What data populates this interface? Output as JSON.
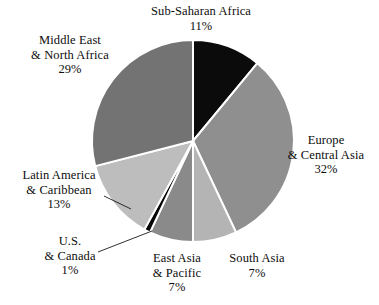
{
  "chart_data": {
    "type": "pie",
    "title": "",
    "subtitle": "",
    "xlabel": "",
    "ylabel": "",
    "legend_position": "none",
    "grid": false,
    "units": "percent",
    "start_angle_deg": 0,
    "direction": "clockwise",
    "categories": [
      "Sub-Saharan Africa",
      "Europe & Central Asia",
      "South Asia",
      "East Asia & Pacific",
      "U.S. & Canada",
      "Latin America & Caribbean",
      "Middle East & North Africa"
    ],
    "values": [
      11,
      32,
      7,
      7,
      1,
      13,
      29
    ],
    "slices": [
      {
        "name": "Sub-Saharan Africa",
        "label_lines": [
          "Sub-Saharan Africa"
        ],
        "value": 11,
        "percent_text": "11%",
        "color": "#0b0b0b",
        "start_deg": 0,
        "end_deg": 39.6,
        "leader_line": false
      },
      {
        "name": "Europe & Central Asia",
        "label_lines": [
          "Europe",
          "& Central Asia"
        ],
        "value": 32,
        "percent_text": "32%",
        "color": "#8f8f8f",
        "start_deg": 39.6,
        "end_deg": 154.8,
        "leader_line": false
      },
      {
        "name": "South Asia",
        "label_lines": [
          "South Asia"
        ],
        "value": 7,
        "percent_text": "7%",
        "color": "#b4b4b4",
        "start_deg": 154.8,
        "end_deg": 180.0,
        "leader_line": false
      },
      {
        "name": "East Asia & Pacific",
        "label_lines": [
          "East Asia",
          "& Pacific"
        ],
        "value": 7,
        "percent_text": "7%",
        "color": "#8a8a8a",
        "start_deg": 180.0,
        "end_deg": 205.2,
        "leader_line": false
      },
      {
        "name": "U.S. & Canada",
        "label_lines": [
          "U.S.",
          "& Canada"
        ],
        "value": 1,
        "percent_text": "1%",
        "color": "#060606",
        "start_deg": 205.2,
        "end_deg": 208.8,
        "leader_line": true
      },
      {
        "name": "Latin America & Caribbean",
        "label_lines": [
          "Latin America",
          "& Caribbean"
        ],
        "value": 13,
        "percent_text": "13%",
        "color": "#bdbdbd",
        "start_deg": 208.8,
        "end_deg": 255.6,
        "leader_line": true
      },
      {
        "name": "Middle East & North Africa",
        "label_lines": [
          "Middle East",
          "& North Africa"
        ],
        "value": 29,
        "percent_text": "29%",
        "color": "#737373",
        "start_deg": 255.6,
        "end_deg": 360.0,
        "leader_line": false
      }
    ],
    "geometry": {
      "center_x": 193,
      "center_y": 141,
      "radius": 101,
      "separator_color": "#ffffff",
      "separator_width": 2
    },
    "background_color": "#ffffff",
    "text_color": "#0d0d0d"
  },
  "labels": {
    "sub_saharan_africa": {
      "line1": "Sub-Saharan Africa",
      "pct": "11%"
    },
    "middle_east": {
      "line1": "Middle East",
      "line2": "& North Africa",
      "pct": "29%"
    },
    "europe": {
      "line1": "Europe",
      "line2": "& Central Asia",
      "pct": "32%"
    },
    "latin_america": {
      "line1": "Latin America",
      "line2": "& Caribbean",
      "pct": "13%"
    },
    "us_canada": {
      "line1": "U.S.",
      "line2": "& Canada",
      "pct": "1%"
    },
    "east_asia": {
      "line1": "East Asia",
      "line2": "& Pacific",
      "pct": "7%"
    },
    "south_asia": {
      "line1": "South Asia",
      "pct": "7%"
    }
  }
}
